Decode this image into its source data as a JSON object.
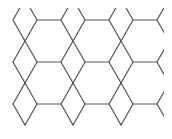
{
  "diagram": {
    "pattern": "hexagon-rhombus tiling",
    "line_color": "#555555",
    "background_color": "#ffffff",
    "tile_columns": 4,
    "tile_rows": 3
  }
}
